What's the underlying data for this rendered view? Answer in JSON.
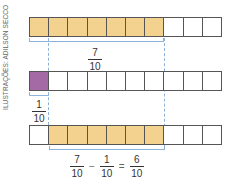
{
  "credit": "ILUSTRAÇÕES: ADILSON SECCO",
  "colors": {
    "tan": "#f3d28f",
    "purple": "#a46aa6",
    "border": "#555555",
    "guide": "#8fb2d8"
  },
  "bars": [
    {
      "cells": [
        "tan",
        "tan",
        "tan",
        "tan",
        "tan",
        "tan",
        "tan",
        "white",
        "white",
        "white"
      ]
    },
    {
      "cells": [
        "purple",
        "white",
        "white",
        "white",
        "white",
        "white",
        "white",
        "white",
        "white",
        "white"
      ]
    },
    {
      "cells": [
        "white",
        "tan",
        "tan",
        "tan",
        "tan",
        "tan",
        "tan",
        "white",
        "white",
        "white"
      ]
    }
  ],
  "labels": {
    "seven_tenths": {
      "num": "7",
      "den": "10"
    },
    "one_tenth": {
      "num": "1",
      "den": "10"
    }
  },
  "equation": {
    "a": {
      "num": "7",
      "den": "10"
    },
    "op1": "−",
    "b": {
      "num": "1",
      "den": "10"
    },
    "op2": "=",
    "c": {
      "num": "6",
      "den": "10"
    }
  }
}
